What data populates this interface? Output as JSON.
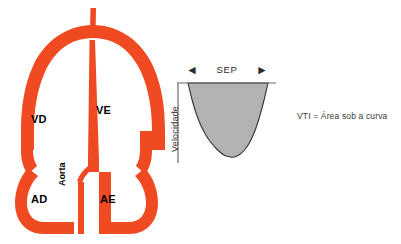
{
  "figure": {
    "background_color": "#ffffff"
  },
  "heart_diagram": {
    "name": "cross-section do coracao",
    "wall_color": "#F04A23",
    "chamber_color": "#ffffff",
    "labels": {
      "vd": "VD",
      "ve": "VE",
      "ad": "AD",
      "ae": "AE",
      "aorta": "Aorta"
    }
  },
  "caption": {
    "vti_text": "VTI = Área sob a curva"
  },
  "chart_data": {
    "type": "area",
    "title": "",
    "xlabel": "",
    "ylabel": "Velocidade",
    "grid": false,
    "legend": null,
    "axis": {
      "baseline_color": "#6b6b6b",
      "y_axis_color": "#6b6b6b",
      "baseline_position": "top",
      "direction": "downward"
    },
    "annotations": [
      {
        "name": "sep-span",
        "label": "SEP",
        "arrow_left": "◄",
        "arrow_right": "►",
        "description": "Período de ejeção sistólica, largura da curva"
      },
      {
        "name": "vti-area",
        "label": "VTI = Área sob a curva",
        "description": "A área hachurada sob a curva representa o VTI"
      }
    ],
    "fill": {
      "style": "vertical-hatch",
      "hatch_color": "#555555",
      "hatch_spacing_px": 2,
      "outline_color": "#333333"
    },
    "x": [
      0,
      0.05,
      0.1,
      0.15,
      0.2,
      0.25,
      0.3,
      0.35,
      0.4,
      0.45,
      0.5,
      0.55,
      0.6,
      0.65,
      0.7,
      0.75,
      0.8,
      0.85,
      0.9,
      0.95,
      1.0
    ],
    "values": [
      0,
      -22,
      -40,
      -54,
      -65,
      -74,
      -81,
      -87,
      -92,
      -96,
      -98,
      -99,
      -98,
      -95,
      -90,
      -83,
      -73,
      -60,
      -43,
      -23,
      0
    ],
    "xlim": [
      0,
      1
    ],
    "ylim": [
      -100,
      0
    ]
  }
}
